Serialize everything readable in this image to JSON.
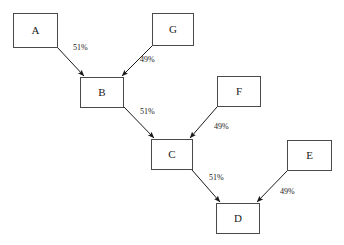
{
  "diagram": {
    "background_color": "#ffffff",
    "node_border_color": "#4a4a4a",
    "node_fill_color": "#ffffff",
    "edge_color": "#1a1a1a",
    "text_color": "#1a1a1a",
    "nodes": [
      {
        "id": "A",
        "label": "A",
        "x": 13,
        "y": 13,
        "w": 45,
        "h": 35
      },
      {
        "id": "G",
        "label": "G",
        "x": 152,
        "y": 13,
        "w": 42,
        "h": 33
      },
      {
        "id": "B",
        "label": "B",
        "x": 80,
        "y": 77,
        "w": 44,
        "h": 31
      },
      {
        "id": "F",
        "label": "F",
        "x": 217,
        "y": 76,
        "w": 44,
        "h": 31
      },
      {
        "id": "C",
        "label": "C",
        "x": 151,
        "y": 139,
        "w": 42,
        "h": 31
      },
      {
        "id": "E",
        "label": "E",
        "x": 287,
        "y": 140,
        "w": 45,
        "h": 31
      },
      {
        "id": "D",
        "label": "D",
        "x": 216,
        "y": 203,
        "w": 44,
        "h": 31
      }
    ],
    "edges": [
      {
        "from": "A",
        "to": "B",
        "label": "51%",
        "x1": 57,
        "y1": 47,
        "x2": 84,
        "y2": 76,
        "label_x": 73,
        "label_y": 44
      },
      {
        "from": "G",
        "to": "B",
        "label": "49%",
        "x1": 152,
        "y1": 46,
        "x2": 122,
        "y2": 76,
        "label_x": 140,
        "label_y": 56
      },
      {
        "from": "B",
        "to": "C",
        "label": "51%",
        "x1": 124,
        "y1": 107,
        "x2": 154,
        "y2": 138,
        "label_x": 140,
        "label_y": 108
      },
      {
        "from": "F",
        "to": "C",
        "label": "49%",
        "x1": 217,
        "y1": 107,
        "x2": 190,
        "y2": 138,
        "label_x": 214,
        "label_y": 123
      },
      {
        "from": "C",
        "to": "D",
        "label": "51%",
        "x1": 192,
        "y1": 170,
        "x2": 220,
        "y2": 202,
        "label_x": 209,
        "label_y": 174
      },
      {
        "from": "E",
        "to": "D",
        "label": "49%",
        "x1": 287,
        "y1": 171,
        "x2": 257,
        "y2": 202,
        "label_x": 280,
        "label_y": 188
      }
    ]
  }
}
